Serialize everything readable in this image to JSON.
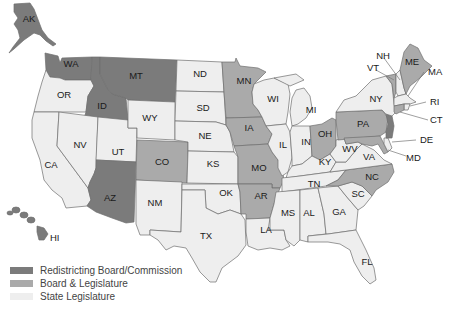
{
  "colors": {
    "commission": "#7b7b7b",
    "board_legislature": "#aaaaaa",
    "legislature": "#eeeeee",
    "border": "#6e6e6e"
  },
  "legend": [
    {
      "key": "commission",
      "label": "Redistricting Board/Commission",
      "color": "#7b7b7b"
    },
    {
      "key": "board_legislature",
      "label": "Board & Legislature",
      "color": "#aaaaaa"
    },
    {
      "key": "legislature",
      "label": "State Legislature",
      "color": "#eeeeee"
    }
  ],
  "states": {
    "AK": {
      "label": "AK",
      "category": "commission"
    },
    "HI": {
      "label": "HI",
      "category": "commission"
    },
    "WA": {
      "label": "WA",
      "category": "commission"
    },
    "OR": {
      "label": "OR",
      "category": "legislature"
    },
    "CA": {
      "label": "CA",
      "category": "legislature"
    },
    "ID": {
      "label": "ID",
      "category": "commission"
    },
    "NV": {
      "label": "NV",
      "category": "legislature"
    },
    "MT": {
      "label": "MT",
      "category": "commission"
    },
    "WY": {
      "label": "WY",
      "category": "legislature"
    },
    "UT": {
      "label": "UT",
      "category": "legislature"
    },
    "AZ": {
      "label": "AZ",
      "category": "commission"
    },
    "CO": {
      "label": "CO",
      "category": "board_legislature"
    },
    "NM": {
      "label": "NM",
      "category": "legislature"
    },
    "ND": {
      "label": "ND",
      "category": "legislature"
    },
    "SD": {
      "label": "SD",
      "category": "legislature"
    },
    "NE": {
      "label": "NE",
      "category": "legislature"
    },
    "KS": {
      "label": "KS",
      "category": "legislature"
    },
    "OK": {
      "label": "OK",
      "category": "legislature"
    },
    "TX": {
      "label": "TX",
      "category": "legislature"
    },
    "MN": {
      "label": "MN",
      "category": "board_legislature"
    },
    "IA": {
      "label": "IA",
      "category": "board_legislature"
    },
    "MO": {
      "label": "MO",
      "category": "board_legislature"
    },
    "AR": {
      "label": "AR",
      "category": "board_legislature"
    },
    "LA": {
      "label": "LA",
      "category": "legislature"
    },
    "WI": {
      "label": "WI",
      "category": "legislature"
    },
    "IL": {
      "label": "IL",
      "category": "legislature"
    },
    "MI": {
      "label": "MI",
      "category": "legislature"
    },
    "IN": {
      "label": "IN",
      "category": "legislature"
    },
    "OH": {
      "label": "OH",
      "category": "board_legislature"
    },
    "KY": {
      "label": "KY",
      "category": "legislature"
    },
    "TN": {
      "label": "TN",
      "category": "legislature"
    },
    "MS": {
      "label": "MS",
      "category": "legislature"
    },
    "AL": {
      "label": "AL",
      "category": "legislature"
    },
    "GA": {
      "label": "GA",
      "category": "legislature"
    },
    "FL": {
      "label": "FL",
      "category": "legislature"
    },
    "SC": {
      "label": "SC",
      "category": "legislature"
    },
    "NC": {
      "label": "NC",
      "category": "board_legislature"
    },
    "VA": {
      "label": "VA",
      "category": "legislature"
    },
    "WV": {
      "label": "WV",
      "category": "legislature"
    },
    "PA": {
      "label": "PA",
      "category": "board_legislature"
    },
    "NY": {
      "label": "NY",
      "category": "legislature"
    },
    "VT": {
      "label": "VT",
      "category": "board_legislature"
    },
    "NH": {
      "label": "NH",
      "category": "legislature"
    },
    "ME": {
      "label": "ME",
      "category": "board_legislature"
    },
    "MA": {
      "label": "MA",
      "category": "legislature"
    },
    "RI": {
      "label": "RI",
      "category": "legislature"
    },
    "CT": {
      "label": "CT",
      "category": "board_legislature"
    },
    "NJ": {
      "label": "",
      "category": "commission"
    },
    "DE": {
      "label": "DE",
      "category": "legislature"
    },
    "MD": {
      "label": "MD",
      "category": "board_legislature"
    }
  }
}
